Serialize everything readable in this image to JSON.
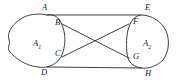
{
  "figure": {
    "background_color": "#ffffff",
    "stroke_color": "#2a2a2a",
    "width": 182,
    "height": 83
  },
  "regions": [
    {
      "id": "A1",
      "label": "A",
      "subscript": "1",
      "shape": "irregular closed blob",
      "label_x": 33,
      "label_y": 39
    },
    {
      "id": "A2",
      "label": "A",
      "subscript": "2",
      "shape": "oval",
      "label_x": 143,
      "label_y": 39
    }
  ],
  "vertices": [
    {
      "id": "A",
      "label": "A",
      "x": 42,
      "y": 3,
      "px": 47,
      "py": 15
    },
    {
      "id": "B",
      "label": "B",
      "x": 55,
      "y": 18,
      "px": 62,
      "py": 24
    },
    {
      "id": "C",
      "label": "C",
      "x": 55,
      "y": 49,
      "px": 62,
      "py": 57
    },
    {
      "id": "D",
      "label": "D",
      "x": 41,
      "y": 68,
      "px": 47,
      "py": 67
    },
    {
      "id": "E",
      "label": "E",
      "x": 145,
      "y": 3,
      "px": 141,
      "py": 15
    },
    {
      "id": "F",
      "label": "F",
      "x": 133,
      "y": 17,
      "px": 129,
      "py": 24
    },
    {
      "id": "G",
      "label": "G",
      "x": 133,
      "y": 52,
      "px": 129,
      "py": 58
    },
    {
      "id": "H",
      "label": "H",
      "x": 145,
      "y": 69,
      "px": 141,
      "py": 68
    }
  ],
  "connectors": [
    {
      "id": "A-E",
      "from": "A",
      "to": "E",
      "type": "line"
    },
    {
      "id": "D-H",
      "from": "D",
      "to": "H",
      "type": "line"
    },
    {
      "id": "B-G",
      "from": "B",
      "to": "G",
      "type": "line"
    },
    {
      "id": "C-F",
      "from": "C",
      "to": "F",
      "type": "line"
    }
  ],
  "crossing_point": {
    "x": 98,
    "y": 41
  }
}
